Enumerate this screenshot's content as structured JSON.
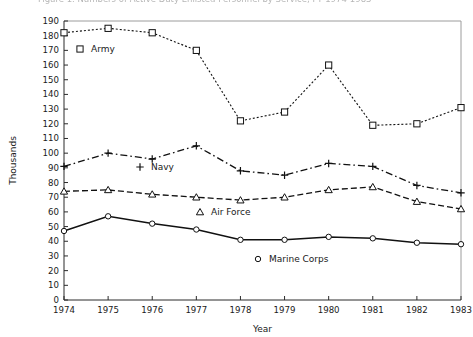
{
  "figure": {
    "caption_fragment": "Figure 1.  Numbers of Active Duty Enlisted Personnel by Service, FY 1974-1983"
  },
  "axes": {
    "ylabel": "Thousands",
    "xlabel": "Year",
    "ylim": [
      0,
      190
    ],
    "ytick_step": 10,
    "yticks": [
      "0",
      "10",
      "20",
      "30",
      "40",
      "50",
      "60",
      "70",
      "80",
      "90",
      "100",
      "110",
      "120",
      "130",
      "140",
      "150",
      "160",
      "170",
      "180",
      "190"
    ],
    "xticks": [
      "1974",
      "1975",
      "1976",
      "1977",
      "1978",
      "1979",
      "1980",
      "1981",
      "1982",
      "1983"
    ],
    "grid": "off"
  },
  "legend": {
    "position": "inline-in-plot",
    "entries": [
      {
        "label": "Army",
        "marker": "square",
        "dash": "dotted"
      },
      {
        "label": "Navy",
        "marker": "plus",
        "dash": "dashdot"
      },
      {
        "label": "Air Force",
        "marker": "triangle",
        "dash": "dashed"
      },
      {
        "label": "Marine Corps",
        "marker": "circle",
        "dash": "solid"
      }
    ]
  },
  "colors": {
    "ink": "#111111",
    "axis": "#2b2b2b",
    "frame": "#9c9c9c",
    "background": "#ffffff"
  },
  "chart_data": {
    "type": "line",
    "title": "Numbers of Active Duty Enlisted Personnel by Service, FY 1974-1983",
    "xlabel": "Year",
    "ylabel": "Thousands",
    "ylim": [
      0,
      190
    ],
    "xlim": [
      "1974",
      "1983"
    ],
    "grid": false,
    "legend_position": "inline-in-plot",
    "categories": [
      "1974",
      "1975",
      "1976",
      "1977",
      "1978",
      "1979",
      "1980",
      "1981",
      "1982",
      "1983"
    ],
    "series": [
      {
        "name": "Army",
        "marker": "square",
        "dash": "dotted",
        "values": [
          182,
          185,
          182,
          170,
          122,
          128,
          160,
          119,
          120,
          131
        ]
      },
      {
        "name": "Navy",
        "marker": "plus",
        "dash": "dashdot",
        "values": [
          91,
          100,
          96,
          105,
          88,
          85,
          93,
          91,
          78,
          73
        ]
      },
      {
        "name": "Air Force",
        "marker": "triangle",
        "dash": "dashed",
        "values": [
          74,
          75,
          72,
          70,
          68,
          70,
          75,
          77,
          67,
          62
        ]
      },
      {
        "name": "Marine Corps",
        "marker": "circle",
        "dash": "solid",
        "values": [
          47,
          57,
          52,
          48,
          41,
          41,
          43,
          42,
          39,
          38
        ]
      }
    ]
  }
}
